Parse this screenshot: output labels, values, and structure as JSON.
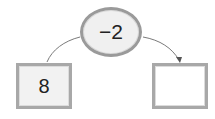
{
  "diagram": {
    "operation": {
      "label": "−2"
    },
    "input": {
      "value": "8"
    },
    "output": {
      "value": ""
    }
  }
}
